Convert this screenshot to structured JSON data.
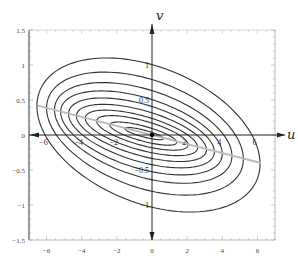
{
  "chart_data": {
    "type": "contour",
    "title": "",
    "xlabel": "u",
    "ylabel": "v",
    "xlim": [
      -7,
      7
    ],
    "ylim": [
      -1.5,
      1.5
    ],
    "grid": false,
    "legend": null,
    "x_ticks": [
      -6,
      -4,
      -2,
      0,
      2,
      4,
      6
    ],
    "y_ticks": [
      -1.5,
      -1,
      -0.5,
      0,
      0.5,
      1,
      1.5
    ],
    "x_tick_labels": [
      "-6",
      "-4",
      "-2",
      "0",
      "2",
      "4",
      "6"
    ],
    "y_tick_labels": [
      "-1.5",
      "-1",
      "-0.5",
      "0",
      "0.5",
      "1",
      "1.5"
    ],
    "inner_axis_tick_labels": {
      "u": [
        "-6",
        "-4",
        "-2",
        "2",
        "4",
        "6"
      ],
      "v": [
        "1",
        "0.5",
        "-0.5",
        "-1"
      ]
    },
    "origin_marker": {
      "u": 0,
      "v": 0
    },
    "principal_line": {
      "from": [
        -6.5,
        0.42
      ],
      "to": [
        6.2,
        -0.4
      ],
      "style": "gray"
    },
    "contours": [
      {
        "level": 1,
        "center": [
          -0.2,
          0.0
        ],
        "semi_u": 6.35,
        "semi_v": 1.02,
        "tilt": -0.065
      },
      {
        "level": 2,
        "center": [
          -0.4,
          0.02
        ],
        "semi_u": 5.6,
        "semi_v": 0.8,
        "tilt": -0.065
      },
      {
        "level": 3,
        "center": [
          -0.5,
          0.03
        ],
        "semi_u": 5.05,
        "semi_v": 0.64,
        "tilt": -0.065
      },
      {
        "level": 4,
        "center": [
          -0.6,
          0.03
        ],
        "semi_u": 4.6,
        "semi_v": 0.52,
        "tilt": -0.065
      },
      {
        "level": 5,
        "center": [
          -0.6,
          0.03
        ],
        "semi_u": 4.15,
        "semi_v": 0.42,
        "tilt": -0.065
      },
      {
        "level": 6,
        "center": [
          -0.6,
          0.03
        ],
        "semi_u": 3.7,
        "semi_v": 0.33,
        "tilt": -0.065
      },
      {
        "level": 7,
        "center": [
          -0.6,
          0.03
        ],
        "semi_u": 3.2,
        "semi_v": 0.25,
        "tilt": -0.065
      },
      {
        "level": 8,
        "center": [
          -0.55,
          0.03
        ],
        "semi_u": 2.6,
        "semi_v": 0.18,
        "tilt": -0.065
      },
      {
        "level": 9,
        "center": [
          -0.5,
          0.02
        ],
        "semi_u": 1.9,
        "semi_v": 0.11,
        "tilt": -0.065
      },
      {
        "level": 10,
        "center": [
          -0.45,
          0.02
        ],
        "semi_u": 1.1,
        "semi_v": 0.05,
        "tilt": -0.065
      }
    ],
    "colors": {
      "contour": "#333333",
      "axis": "#222222",
      "frame": "#999999",
      "principal_line": "#bbbbbb"
    }
  }
}
